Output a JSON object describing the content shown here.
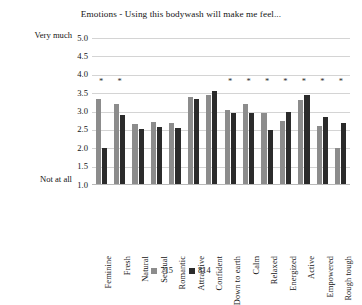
{
  "chart_data": {
    "type": "bar",
    "title": "Emotions - Using this bodywash will make me feel...",
    "xlabel": "",
    "ylabel": "",
    "ylim": [
      1.0,
      5.0
    ],
    "ytick_labels": [
      "5.0",
      "4.5",
      "4.0",
      "3.5",
      "3.0",
      "2.5",
      "2.0",
      "1.5",
      "1.0"
    ],
    "ytick_values": [
      5.0,
      4.5,
      4.0,
      3.5,
      3.0,
      2.5,
      2.0,
      1.5,
      1.0
    ],
    "scale_anchor_high": "Very much",
    "scale_anchor_low": "Not at all",
    "grid": true,
    "legend_position": "bottom",
    "categories": [
      "Feminine",
      "Fresh",
      "Natural",
      "Sensual",
      "Romantic",
      "Attractive",
      "Confident",
      "Down to earth",
      "Calm",
      "Relaxed",
      "Energized",
      "Active",
      "Empowered",
      "Rough tough"
    ],
    "series": [
      {
        "name": "715",
        "color": "#8c8c8c",
        "values": [
          3.35,
          3.2,
          2.65,
          2.72,
          2.7,
          3.4,
          3.45,
          3.05,
          3.2,
          2.95,
          2.75,
          3.3,
          2.6,
          2.0
        ]
      },
      {
        "name": "814",
        "color": "#2b2b2b",
        "values": [
          2.0,
          2.9,
          2.52,
          2.58,
          2.55,
          3.35,
          3.55,
          2.95,
          2.95,
          2.5,
          3.0,
          3.45,
          2.85,
          2.7
        ]
      }
    ],
    "significance_marker": "*",
    "significance_marker_value": 3.88,
    "significance_flags": [
      true,
      true,
      false,
      false,
      false,
      false,
      false,
      true,
      true,
      true,
      true,
      true,
      true,
      true
    ],
    "annotations": [
      "Asterisks above bars indicate statistically significant differences between groups 715 and 814."
    ]
  }
}
